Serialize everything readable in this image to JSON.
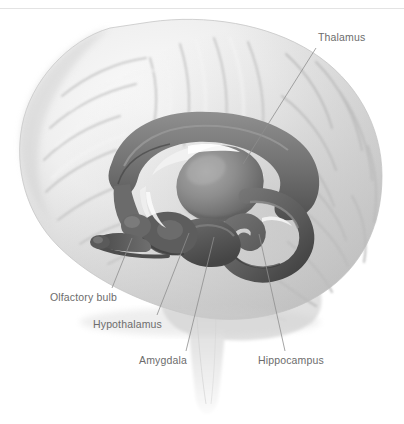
{
  "figure": {
    "title_visible": false,
    "background_color": "#ffffff",
    "rule_color": "#e3e3e3",
    "label_color": "#6c6c6c",
    "leader_color": "#8e8e8e"
  },
  "labels": [
    {
      "id": "thalamus",
      "text": "Thalamus",
      "x": 318,
      "y": 31,
      "leader": {
        "x1": 316,
        "y1": 48,
        "x2": 243,
        "y2": 164
      }
    },
    {
      "id": "olfactory-bulb",
      "text": "Olfactory bulb",
      "x": 50,
      "y": 291,
      "leader": {
        "x1": 112,
        "y1": 288,
        "x2": 132,
        "y2": 238
      }
    },
    {
      "id": "hypothalamus",
      "text": "Hypothalamus",
      "x": 93,
      "y": 318,
      "leader": {
        "x1": 157,
        "y1": 315,
        "x2": 189,
        "y2": 233
      }
    },
    {
      "id": "amygdala",
      "text": "Amygdala",
      "x": 139,
      "y": 354,
      "leader": {
        "x1": 186,
        "y1": 351,
        "x2": 214,
        "y2": 237
      }
    },
    {
      "id": "hippocampus",
      "text": "Hippocampus",
      "x": 258,
      "y": 354,
      "leader": {
        "x1": 285,
        "y1": 351,
        "x2": 259,
        "y2": 234
      }
    }
  ],
  "structures": {
    "cerebrum": "outer cerebral cortex with gyri and sulci, pale gray",
    "corpus_callosum": "arched mid gray band above thalamus",
    "thalamus": "large rounded egg-shaped mid-gray mass at center",
    "hippocampus": "curved dark gray seahorse form, posterior inferior",
    "amygdala": "dark gray almond mass anterior to hippocampus",
    "hypothalamus": "dark gray region below thalamus",
    "olfactory_bulb": "slender dark gray tract extending anterior-inferior",
    "brainstem": "pale vertical stalk descending at bottom center",
    "cerebellum": "pale lobed region posterior inferior"
  }
}
